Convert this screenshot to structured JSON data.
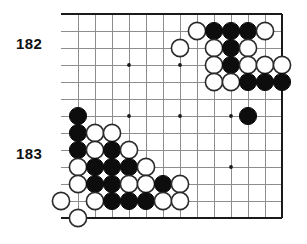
{
  "diagram": {
    "type": "go-board-problem",
    "move_labels": [
      {
        "id": "182",
        "text": "182"
      },
      {
        "id": "183",
        "text": "183"
      }
    ],
    "board": {
      "visible_columns": 13,
      "visible_rows": 13,
      "origin_x": 78,
      "origin_y": 14,
      "spacing": 17,
      "stone_radius": 8.6,
      "grid_color": "#8d8d8d",
      "edge_color": "#1a1a1a",
      "black_color": "#0d0d0d",
      "white_color": "#ffffff",
      "edges": {
        "top": true,
        "right": true,
        "bottom": true,
        "left": false
      },
      "star_points": [
        {
          "col": 3,
          "row": 3
        },
        {
          "col": 6,
          "row": 3
        },
        {
          "col": 3,
          "row": 6
        },
        {
          "col": 6,
          "row": 6
        },
        {
          "col": 9,
          "row": 6
        },
        {
          "col": 9,
          "row": 9
        }
      ],
      "stones": [
        {
          "col": 7,
          "row": 1,
          "color": "white"
        },
        {
          "col": 8,
          "row": 1,
          "color": "black"
        },
        {
          "col": 9,
          "row": 1,
          "color": "black"
        },
        {
          "col": 10,
          "row": 1,
          "color": "black"
        },
        {
          "col": 11,
          "row": 1,
          "color": "white"
        },
        {
          "col": 6,
          "row": 2,
          "color": "white"
        },
        {
          "col": 8,
          "row": 2,
          "color": "white"
        },
        {
          "col": 9,
          "row": 2,
          "color": "black"
        },
        {
          "col": 10,
          "row": 2,
          "color": "white"
        },
        {
          "col": 8,
          "row": 3,
          "color": "white"
        },
        {
          "col": 9,
          "row": 3,
          "color": "black"
        },
        {
          "col": 10,
          "row": 3,
          "color": "white"
        },
        {
          "col": 11,
          "row": 3,
          "color": "white"
        },
        {
          "col": 12,
          "row": 3,
          "color": "white"
        },
        {
          "col": 8,
          "row": 4,
          "color": "white"
        },
        {
          "col": 9,
          "row": 4,
          "color": "white"
        },
        {
          "col": 10,
          "row": 4,
          "color": "black"
        },
        {
          "col": 11,
          "row": 4,
          "color": "black"
        },
        {
          "col": 12,
          "row": 4,
          "color": "black"
        },
        {
          "col": 0,
          "row": 6,
          "color": "black"
        },
        {
          "col": 10,
          "row": 6,
          "color": "black"
        },
        {
          "col": 0,
          "row": 7,
          "color": "black"
        },
        {
          "col": 1,
          "row": 7,
          "color": "white"
        },
        {
          "col": 2,
          "row": 7,
          "color": "white"
        },
        {
          "col": 0,
          "row": 8,
          "color": "black"
        },
        {
          "col": 1,
          "row": 8,
          "color": "white"
        },
        {
          "col": 2,
          "row": 8,
          "color": "black"
        },
        {
          "col": 3,
          "row": 8,
          "color": "white"
        },
        {
          "col": 0,
          "row": 9,
          "color": "white"
        },
        {
          "col": 1,
          "row": 9,
          "color": "black"
        },
        {
          "col": 2,
          "row": 9,
          "color": "black"
        },
        {
          "col": 3,
          "row": 9,
          "color": "black"
        },
        {
          "col": 4,
          "row": 9,
          "color": "white"
        },
        {
          "col": 0,
          "row": 10,
          "color": "white"
        },
        {
          "col": 1,
          "row": 10,
          "color": "black"
        },
        {
          "col": 2,
          "row": 10,
          "color": "black"
        },
        {
          "col": 3,
          "row": 10,
          "color": "white"
        },
        {
          "col": 4,
          "row": 10,
          "color": "white"
        },
        {
          "col": 5,
          "row": 10,
          "color": "black"
        },
        {
          "col": 6,
          "row": 10,
          "color": "white"
        },
        {
          "col": -1,
          "row": 11,
          "color": "white"
        },
        {
          "col": 1,
          "row": 11,
          "color": "white"
        },
        {
          "col": 2,
          "row": 11,
          "color": "black"
        },
        {
          "col": 3,
          "row": 11,
          "color": "black"
        },
        {
          "col": 4,
          "row": 11,
          "color": "black"
        },
        {
          "col": 5,
          "row": 11,
          "color": "white"
        },
        {
          "col": 6,
          "row": 11,
          "color": "white"
        },
        {
          "col": 0,
          "row": 12,
          "color": "white"
        }
      ]
    }
  }
}
